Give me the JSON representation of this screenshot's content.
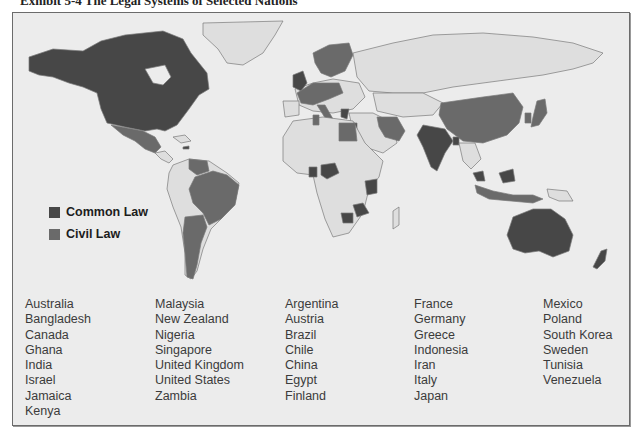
{
  "title": "Exhibit 5-4  The Legal Systems of Selected Nations",
  "colors": {
    "common_law": "#474747",
    "civil_law": "#6a6a6a",
    "other_country": "#dedede",
    "ocean": "#ececec",
    "border": "#7a7a7a"
  },
  "legend": {
    "items": [
      {
        "label": "Common Law",
        "color": "#474747"
      },
      {
        "label": "Civil Law",
        "color": "#6a6a6a"
      }
    ]
  },
  "common_law_countries": {
    "columns": [
      [
        "Australia",
        "Bangladesh",
        "Canada",
        "Ghana",
        "India",
        "Israel",
        "Jamaica",
        "Kenya"
      ],
      [
        "Malaysia",
        "New Zealand",
        "Nigeria",
        "Singapore",
        "United Kingdom",
        "United States",
        "Zambia"
      ]
    ]
  },
  "civil_law_countries": {
    "columns": [
      [
        "Argentina",
        "Austria",
        "Brazil",
        "Chile",
        "China",
        "Egypt",
        "Finland"
      ],
      [
        "France",
        "Germany",
        "Greece",
        "Indonesia",
        "Iran",
        "Italy",
        "Japan"
      ],
      [
        "Mexico",
        "Poland",
        "South Korea",
        "Sweden",
        "Tunisia",
        "Venezuela"
      ]
    ]
  }
}
